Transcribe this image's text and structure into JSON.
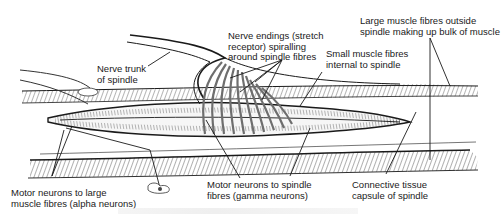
{
  "diagram": {
    "labels": {
      "nerve_trunk": "Nerve trunk\nof spindle",
      "nerve_endings": "Nerve endings (stretch\nreceptor) spiralling\naround spindle fibres",
      "small_fibres": "Small muscle fibres\ninternal to spindle",
      "large_fibres": "Large muscle fibres outside\nspindle making up bulk of muscle",
      "alpha_neurons": "Motor neurons to large\nmuscle fibres (alpha neurons)",
      "gamma_neurons": "Motor neurons to spindle\nfibres (gamma neurons)",
      "capsule": "Connective tissue\ncapsule of spindle"
    },
    "colors": {
      "ink": "#1a1a1a",
      "spiral": "#6e6e6e",
      "background": "#ffffff"
    }
  }
}
